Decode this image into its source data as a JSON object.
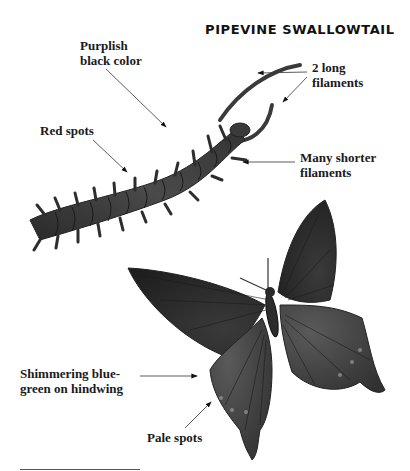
{
  "title": "PIPEVINE SWALLOWTAIL",
  "labels": {
    "purplish": [
      "Purplish",
      "black color"
    ],
    "long_filaments": [
      "2 long",
      "filaments"
    ],
    "red_spots": "Red spots",
    "shorter_filaments": [
      "Many shorter",
      "filaments"
    ],
    "shimmering": [
      "Shimmering blue-",
      "green on hindwing"
    ],
    "pale_spots": "Pale spots"
  }
}
